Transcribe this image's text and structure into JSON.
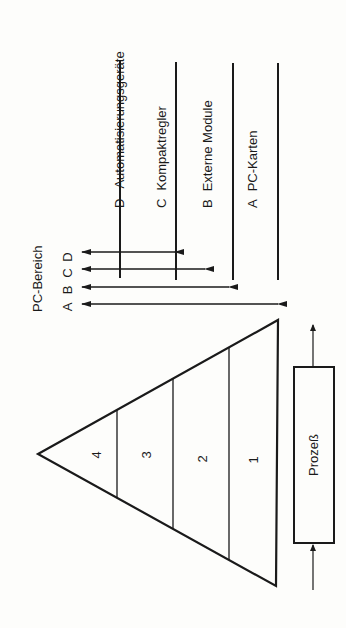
{
  "diagram": {
    "scope_label": "PC-Bereich",
    "scope_letters": [
      "A",
      "B",
      "C",
      "D"
    ],
    "categories": [
      {
        "letter": "D",
        "name": "Automatisierungsgeräte"
      },
      {
        "letter": "C",
        "name": "Kompaktregler"
      },
      {
        "letter": "B",
        "name": "Externe Module"
      },
      {
        "letter": "A",
        "name": "PC-Karten"
      }
    ],
    "pyramid_levels": [
      "4",
      "3",
      "2",
      "1"
    ],
    "process_label": "Prozeß",
    "colors": {
      "ink": "#1a1a1a",
      "paper": "#fdfdfb"
    }
  }
}
